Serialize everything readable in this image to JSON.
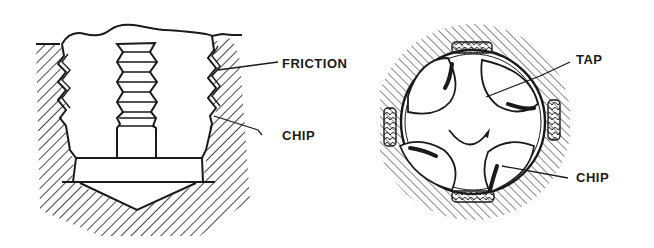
{
  "figure": {
    "left_view": {
      "labels": [
        {
          "id": "friction",
          "text": "FRICTION"
        },
        {
          "id": "chip",
          "text": "CHIP"
        }
      ]
    },
    "right_view": {
      "labels": [
        {
          "id": "tap",
          "text": "TAP"
        },
        {
          "id": "chip",
          "text": "CHIP"
        }
      ]
    }
  },
  "colors": {
    "ink": "#1a1a1a",
    "background": "#ffffff"
  }
}
